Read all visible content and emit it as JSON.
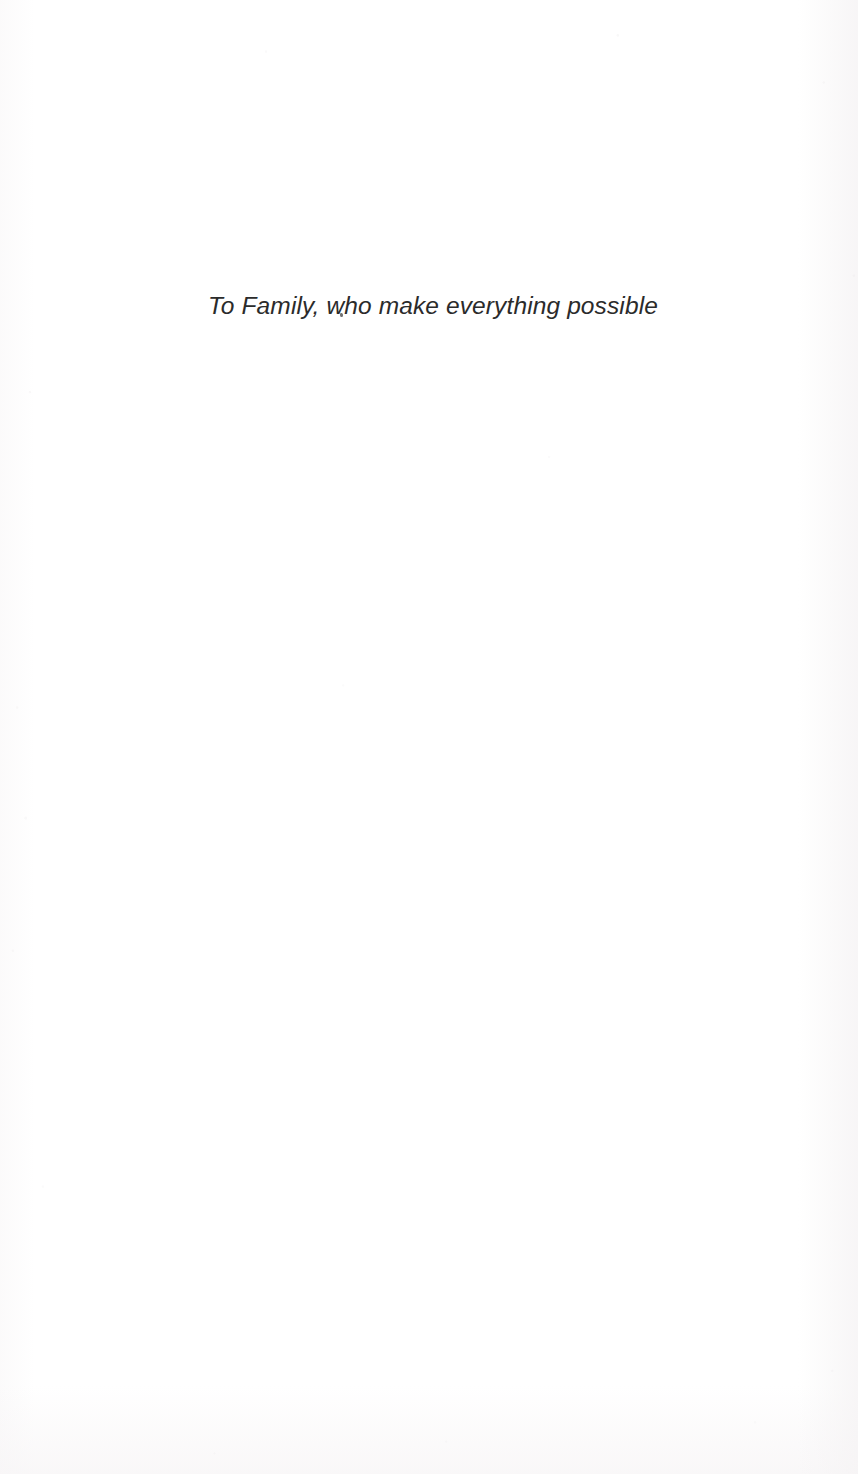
{
  "page": {
    "kind": "book-dedication-page",
    "background_color": "#ffffff",
    "width": 858,
    "height": 1474
  },
  "dedication": {
    "text": "To Family, who make everything possible",
    "style": "italic",
    "text_color": "#2b2b2b",
    "alignment": "center"
  },
  "artifacts": {
    "dust_speck_label": ""
  }
}
